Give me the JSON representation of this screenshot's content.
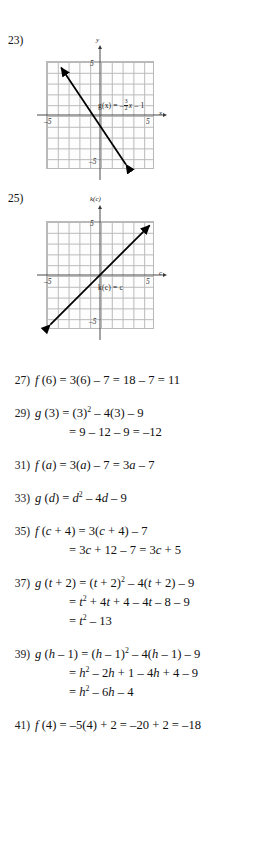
{
  "page": {
    "type": "math-answer-key",
    "background": "#ffffff"
  },
  "figures": [
    {
      "number": "23)",
      "graph": {
        "x_axis_label": "x",
        "y_axis_label": "y",
        "x_tick_neg": "–5",
        "x_tick_pos": "5",
        "y_tick_pos": "5",
        "y_tick_neg": "–5",
        "equation_lhs": "g(x) =",
        "equation_sign": "–",
        "equation_frac_num": "3",
        "equation_frac_den": "2",
        "equation_var": "x",
        "equation_tail": "– 1",
        "equation_plain": "g(x) = -3/2 x - 1",
        "line_color": "#000000",
        "grid_color": "#b9b9b9",
        "axis_color": "#4a4a4a",
        "x_range": [
          -5,
          5
        ],
        "y_range": [
          -5,
          5
        ],
        "slope": -1.5,
        "intercept": -1,
        "point_a": [
          -3.6,
          4.4
        ],
        "point_b": [
          2.4,
          -4.6
        ]
      }
    },
    {
      "number": "25)",
      "graph": {
        "x_axis_label": "c",
        "y_axis_label": "k(c)",
        "x_tick_neg": "–5",
        "x_tick_pos": "5",
        "y_tick_pos": "5",
        "y_tick_neg": "–5",
        "equation_plain": "k(c) = c",
        "equation_lhs": "k(c) = c",
        "line_color": "#000000",
        "grid_color": "#b9b9b9",
        "axis_color": "#4a4a4a",
        "x_range": [
          -5,
          5
        ],
        "y_range": [
          -5,
          5
        ],
        "slope": 1,
        "intercept": 0,
        "point_a": [
          -4.6,
          -4.6
        ],
        "point_b": [
          4.6,
          4.6
        ]
      }
    }
  ],
  "solutions": [
    {
      "number": "27)",
      "lines": [
        {
          "indent": false,
          "parts": [
            {
              "t": "i",
              "v": "f"
            },
            {
              "t": "s",
              "v": " (6) = 3(6) – 7 = 18 – 7 = 11"
            }
          ]
        }
      ]
    },
    {
      "number": "29)",
      "lines": [
        {
          "indent": false,
          "parts": [
            {
              "t": "i",
              "v": "g"
            },
            {
              "t": "s",
              "v": " (3) = (3)"
            },
            {
              "t": "sup",
              "v": "2"
            },
            {
              "t": "s",
              "v": " – 4(3) – 9"
            }
          ]
        },
        {
          "indent": true,
          "parts": [
            {
              "t": "s",
              "v": "= 9 – 12 – 9 = –12"
            }
          ]
        }
      ]
    },
    {
      "number": "31)",
      "lines": [
        {
          "indent": false,
          "parts": [
            {
              "t": "i",
              "v": "f"
            },
            {
              "t": "s",
              "v": " ("
            },
            {
              "t": "i",
              "v": "a"
            },
            {
              "t": "s",
              "v": ") = 3("
            },
            {
              "t": "i",
              "v": "a"
            },
            {
              "t": "s",
              "v": ") – 7 = 3"
            },
            {
              "t": "i",
              "v": "a"
            },
            {
              "t": "s",
              "v": " – 7"
            }
          ]
        }
      ]
    },
    {
      "number": "33)",
      "lines": [
        {
          "indent": false,
          "parts": [
            {
              "t": "i",
              "v": "g"
            },
            {
              "t": "s",
              "v": " ("
            },
            {
              "t": "i",
              "v": "d"
            },
            {
              "t": "s",
              "v": ") = "
            },
            {
              "t": "i",
              "v": "d"
            },
            {
              "t": "sup",
              "v": "2"
            },
            {
              "t": "s",
              "v": " – 4"
            },
            {
              "t": "i",
              "v": "d"
            },
            {
              "t": "s",
              "v": " – 9"
            }
          ]
        }
      ]
    },
    {
      "number": "35)",
      "lines": [
        {
          "indent": false,
          "parts": [
            {
              "t": "i",
              "v": "f"
            },
            {
              "t": "s",
              "v": " ("
            },
            {
              "t": "i",
              "v": "c"
            },
            {
              "t": "s",
              "v": " + 4) = 3("
            },
            {
              "t": "i",
              "v": "c"
            },
            {
              "t": "s",
              "v": " + 4) – 7"
            }
          ]
        },
        {
          "indent": true,
          "parts": [
            {
              "t": "s",
              "v": "= 3"
            },
            {
              "t": "i",
              "v": "c"
            },
            {
              "t": "s",
              "v": " + 12 – 7 = 3"
            },
            {
              "t": "i",
              "v": "c"
            },
            {
              "t": "s",
              "v": " + 5"
            }
          ]
        }
      ]
    },
    {
      "number": "37)",
      "lines": [
        {
          "indent": false,
          "parts": [
            {
              "t": "i",
              "v": "g"
            },
            {
              "t": "s",
              "v": " ("
            },
            {
              "t": "i",
              "v": "t"
            },
            {
              "t": "s",
              "v": " + 2) = ("
            },
            {
              "t": "i",
              "v": "t"
            },
            {
              "t": "s",
              "v": " + 2)"
            },
            {
              "t": "sup",
              "v": "2"
            },
            {
              "t": "s",
              "v": " – 4("
            },
            {
              "t": "i",
              "v": "t"
            },
            {
              "t": "s",
              "v": " + 2) – 9"
            }
          ]
        },
        {
          "indent": true,
          "parts": [
            {
              "t": "s",
              "v": "= "
            },
            {
              "t": "i",
              "v": "t"
            },
            {
              "t": "sup",
              "v": "2"
            },
            {
              "t": "s",
              "v": " + 4"
            },
            {
              "t": "i",
              "v": "t"
            },
            {
              "t": "s",
              "v": " + 4 – 4"
            },
            {
              "t": "i",
              "v": "t"
            },
            {
              "t": "s",
              "v": " – 8 – 9"
            }
          ]
        },
        {
          "indent": true,
          "parts": [
            {
              "t": "s",
              "v": "= "
            },
            {
              "t": "i",
              "v": "t"
            },
            {
              "t": "sup",
              "v": "2"
            },
            {
              "t": "s",
              "v": " – 13"
            }
          ]
        }
      ]
    },
    {
      "number": "39)",
      "lines": [
        {
          "indent": false,
          "parts": [
            {
              "t": "i",
              "v": "g"
            },
            {
              "t": "s",
              "v": " ("
            },
            {
              "t": "i",
              "v": "h"
            },
            {
              "t": "s",
              "v": " – 1) = ("
            },
            {
              "t": "i",
              "v": "h"
            },
            {
              "t": "s",
              "v": " – 1)"
            },
            {
              "t": "sup",
              "v": "2"
            },
            {
              "t": "s",
              "v": " – 4("
            },
            {
              "t": "i",
              "v": "h"
            },
            {
              "t": "s",
              "v": " – 1) – 9"
            }
          ]
        },
        {
          "indent": true,
          "parts": [
            {
              "t": "s",
              "v": "= "
            },
            {
              "t": "i",
              "v": "h"
            },
            {
              "t": "sup",
              "v": "2"
            },
            {
              "t": "s",
              "v": " – 2"
            },
            {
              "t": "i",
              "v": "h"
            },
            {
              "t": "s",
              "v": " + 1 – 4"
            },
            {
              "t": "i",
              "v": "h"
            },
            {
              "t": "s",
              "v": " + 4 – 9"
            }
          ]
        },
        {
          "indent": true,
          "parts": [
            {
              "t": "s",
              "v": "= "
            },
            {
              "t": "i",
              "v": "h"
            },
            {
              "t": "sup",
              "v": "2"
            },
            {
              "t": "s",
              "v": " – 6"
            },
            {
              "t": "i",
              "v": "h"
            },
            {
              "t": "s",
              "v": " – 4"
            }
          ]
        }
      ]
    },
    {
      "number": "41)",
      "lines": [
        {
          "indent": false,
          "parts": [
            {
              "t": "i",
              "v": "f"
            },
            {
              "t": "s",
              "v": " (4) = –5(4) + 2 = –20 + 2 = –18"
            }
          ]
        }
      ]
    }
  ]
}
